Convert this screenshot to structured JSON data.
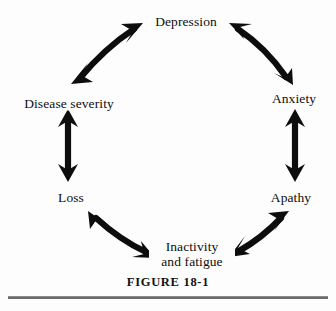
{
  "figure": {
    "caption": "FIGURE 18-1",
    "ink_color": "#0d0d0d",
    "background_color": "#fdfdfd",
    "rule_color": "#6b6b6b"
  },
  "diagram": {
    "type": "cycle",
    "direction": "bidirectional",
    "node_count": 6,
    "nodes": [
      {
        "id": "depression",
        "label": "Depression",
        "position": "top"
      },
      {
        "id": "anxiety",
        "label": "Anxiety",
        "position": "upper-right"
      },
      {
        "id": "apathy",
        "label": "Apathy",
        "position": "lower-right"
      },
      {
        "id": "inactivity",
        "label": "Inactivity",
        "label_line2": "and fatigue",
        "position": "bottom"
      },
      {
        "id": "loss",
        "label": "Loss",
        "position": "lower-left"
      },
      {
        "id": "disease-severity",
        "label": "Disease severity",
        "position": "upper-left"
      }
    ],
    "edges": [
      {
        "from": "depression",
        "to": "anxiety",
        "arrowheads": "both"
      },
      {
        "from": "anxiety",
        "to": "apathy",
        "arrowheads": "both"
      },
      {
        "from": "apathy",
        "to": "inactivity",
        "arrowheads": "both"
      },
      {
        "from": "inactivity",
        "to": "loss",
        "arrowheads": "both"
      },
      {
        "from": "loss",
        "to": "disease-severity",
        "arrowheads": "both"
      },
      {
        "from": "disease-severity",
        "to": "depression",
        "arrowheads": "both"
      }
    ]
  }
}
